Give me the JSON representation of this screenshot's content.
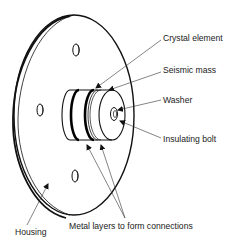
{
  "diagram": {
    "type": "labeled technical illustration",
    "colors": {
      "line": "#111111",
      "background": "#ffffff",
      "text": "#1a1a1a"
    },
    "labels": {
      "crystal_element": "Crystal element",
      "seismic_mass": "Seismic mass",
      "washer": "Washer",
      "insulating_bolt": "Insulating bolt",
      "metal_layers": "Metal layers to form connections",
      "housing": "Housing"
    }
  }
}
